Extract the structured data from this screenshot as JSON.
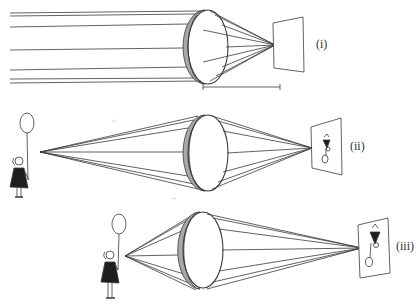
{
  "figure": {
    "colors": {
      "line": "#3a3a3a",
      "lens_rim": "#9a9a9a",
      "background": "#ffffff"
    }
  },
  "panels": [
    {
      "id": "i",
      "label": "(i)",
      "object": "distant (parallel rays)",
      "has_focal_length_marker": true
    },
    {
      "id": "ii",
      "label": "(ii)",
      "object": "girl with balloon, far",
      "image": "inverted small image"
    },
    {
      "id": "iii",
      "label": "(iii)",
      "object": "girl with balloon, near",
      "image": "inverted larger image"
    }
  ]
}
